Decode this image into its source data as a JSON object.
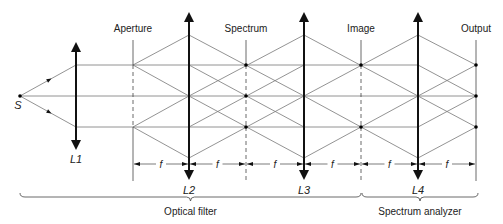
{
  "source": {
    "label": "S",
    "x": 20,
    "y": 96
  },
  "axis_y": 96,
  "ray_levels": [
    35,
    65,
    96,
    127,
    158
  ],
  "lenses": [
    {
      "id": "L1",
      "label": "L1",
      "x": 76,
      "top": 42,
      "bottom": 150,
      "label_y": 154
    },
    {
      "id": "L2",
      "label": "L2",
      "x": 189,
      "top": 12,
      "bottom": 180,
      "label_y": 185
    },
    {
      "id": "L3",
      "label": "L3",
      "x": 304,
      "top": 12,
      "bottom": 180,
      "label_y": 185
    },
    {
      "id": "L4",
      "label": "L4",
      "x": 418,
      "top": 12,
      "bottom": 180,
      "label_y": 185
    }
  ],
  "planes": [
    {
      "id": "aperture",
      "label": "Aperture",
      "x": 133,
      "top": 40,
      "bottom": 181,
      "dashed": true,
      "dots": []
    },
    {
      "id": "spectrum",
      "label": "Spectrum",
      "x": 246,
      "top": 40,
      "bottom": 181,
      "dashed": true,
      "dots": [
        65,
        96,
        127
      ]
    },
    {
      "id": "image",
      "label": "Image",
      "x": 361,
      "top": 40,
      "bottom": 181,
      "dashed": true,
      "dots": [
        65,
        127
      ]
    },
    {
      "id": "output",
      "label": "Output",
      "x": 476,
      "top": 40,
      "bottom": 181,
      "dashed": false,
      "dots": [
        65,
        96,
        127
      ]
    }
  ],
  "plane_label_y": 24,
  "focal_label": "f",
  "dimension_y": 164,
  "dimensions": [
    [
      133,
      189
    ],
    [
      189,
      246
    ],
    [
      246,
      304
    ],
    [
      304,
      361
    ],
    [
      361,
      418
    ],
    [
      418,
      476
    ]
  ],
  "braces": [
    {
      "label": "Optical filter",
      "x1": 20,
      "x2": 361,
      "y": 197
    },
    {
      "label": "Spectrum analyzer",
      "x1": 362,
      "x2": 478,
      "y": 197
    }
  ],
  "rays": [
    [
      20,
      96,
      76,
      65
    ],
    [
      20,
      96,
      76,
      127
    ],
    [
      20,
      96,
      133,
      96
    ],
    [
      76,
      65,
      133,
      65
    ],
    [
      76,
      127,
      133,
      127
    ],
    [
      133,
      65,
      189,
      35
    ],
    [
      133,
      65,
      189,
      96
    ],
    [
      133,
      65,
      189,
      65
    ],
    [
      133,
      127,
      189,
      158
    ],
    [
      133,
      127,
      189,
      96
    ],
    [
      133,
      127,
      189,
      127
    ],
    [
      133,
      96,
      189,
      96
    ],
    [
      189,
      35,
      304,
      96
    ],
    [
      189,
      65,
      304,
      127
    ],
    [
      189,
      96,
      304,
      158
    ],
    [
      189,
      96,
      304,
      35
    ],
    [
      189,
      127,
      304,
      65
    ],
    [
      189,
      158,
      304,
      96
    ],
    [
      189,
      65,
      304,
      65
    ],
    [
      189,
      96,
      304,
      96
    ],
    [
      189,
      127,
      304,
      127
    ],
    [
      304,
      35,
      418,
      96
    ],
    [
      304,
      96,
      418,
      35
    ],
    [
      304,
      96,
      418,
      158
    ],
    [
      304,
      158,
      418,
      96
    ],
    [
      304,
      65,
      418,
      65
    ],
    [
      304,
      96,
      418,
      96
    ],
    [
      304,
      127,
      418,
      127
    ],
    [
      418,
      35,
      476,
      65
    ],
    [
      418,
      96,
      476,
      65
    ],
    [
      418,
      65,
      476,
      96
    ],
    [
      418,
      96,
      476,
      96
    ],
    [
      418,
      127,
      476,
      96
    ],
    [
      418,
      96,
      476,
      127
    ],
    [
      418,
      158,
      476,
      127
    ]
  ],
  "ray_arrows": [
    {
      "x": 48,
      "y": 80.5,
      "dir": "up"
    },
    {
      "x": 48,
      "y": 111.5,
      "dir": "down"
    }
  ],
  "colors": {
    "ray": "#777777",
    "lens": "#111111",
    "plane": "#444444",
    "dot": "#000000"
  }
}
